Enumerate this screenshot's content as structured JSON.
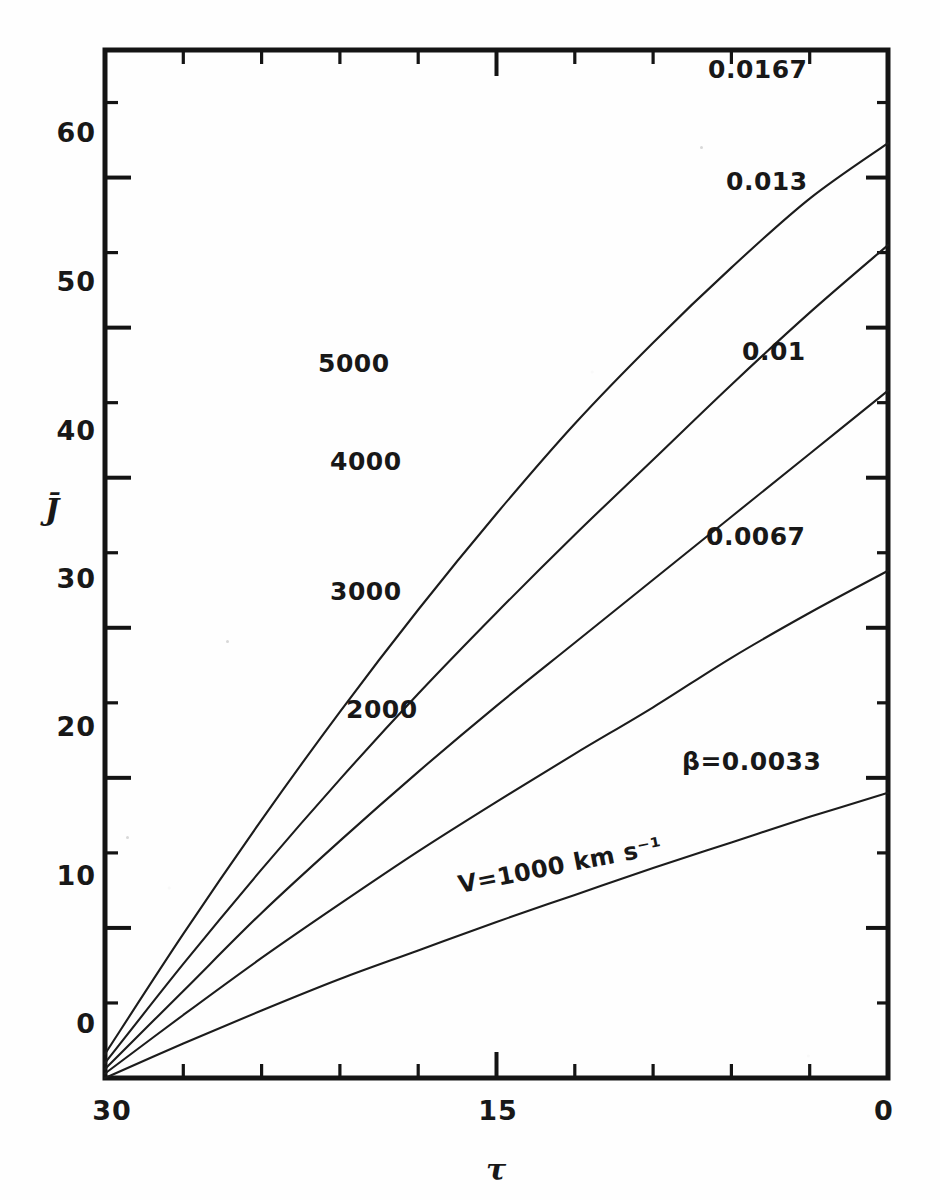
{
  "figure": {
    "kind": "line-plot",
    "background": "#fefefe",
    "ink_color": "#181818"
  },
  "chart_data": {
    "type": "line",
    "title": "",
    "subtitle": "",
    "xlabel": "τ",
    "ylabel": "J̄",
    "xlim": [
      30,
      0
    ],
    "ylim": [
      0,
      68.5
    ],
    "x_reversed": true,
    "grid": false,
    "legend_position": "inline-curve-labels",
    "xticks_major": [
      30,
      15,
      0
    ],
    "xtick_labels": [
      "30",
      "15",
      "0"
    ],
    "xticks_minor": [
      27,
      24,
      21,
      18,
      12,
      9,
      6,
      3
    ],
    "yticks_major": [
      0,
      10,
      20,
      30,
      40,
      50,
      60
    ],
    "ytick_labels": [
      "0",
      "10",
      "20",
      "30",
      "40",
      "50",
      "60"
    ],
    "series": [
      {
        "name": "beta=0.0033",
        "beta_label": "β=0.0033",
        "velocity_label": "V=1000 km s⁻¹",
        "beta": 0.0033,
        "velocity_km_s": 1000,
        "x": [
          30,
          27,
          24,
          21,
          18,
          15,
          12,
          9,
          6,
          3,
          0
        ],
        "y": [
          0.0,
          2.3,
          4.5,
          6.6,
          8.5,
          10.4,
          12.2,
          14.0,
          15.7,
          17.4,
          19.0
        ]
      },
      {
        "name": "beta=0.0067",
        "beta_label": "0.0067",
        "velocity_label": "2000",
        "beta": 0.0067,
        "velocity_km_s": 2000,
        "x": [
          30,
          27,
          24,
          21,
          18,
          15,
          12,
          9,
          6,
          3,
          0
        ],
        "y": [
          0.3,
          4.2,
          8.0,
          11.6,
          15.1,
          18.4,
          21.6,
          24.7,
          28.0,
          31.0,
          33.8
        ]
      },
      {
        "name": "beta=0.01",
        "beta_label": "0.01",
        "velocity_label": "3000",
        "beta": 0.01,
        "velocity_km_s": 3000,
        "x": [
          30,
          27,
          24,
          21,
          18,
          15,
          12,
          9,
          6,
          3,
          0
        ],
        "y": [
          0.6,
          5.8,
          11.0,
          15.8,
          20.4,
          24.8,
          29.0,
          33.2,
          37.4,
          41.6,
          45.8
        ]
      },
      {
        "name": "beta=0.013",
        "beta_label": "0.013",
        "velocity_label": "4000",
        "beta": 0.013,
        "velocity_km_s": 4000,
        "x": [
          30,
          27,
          24,
          21,
          18,
          15,
          12,
          9,
          6,
          3,
          0
        ],
        "y": [
          1.0,
          7.6,
          13.9,
          19.9,
          25.6,
          31.0,
          36.2,
          41.2,
          46.2,
          51.0,
          55.5
        ]
      },
      {
        "name": "beta=0.0167",
        "beta_label": "0.0167",
        "velocity_label": "5000",
        "beta": 0.0167,
        "velocity_km_s": 5000,
        "x": [
          30,
          27,
          24,
          21,
          18,
          15,
          12,
          9,
          6,
          3,
          0
        ],
        "y": [
          1.6,
          9.6,
          17.2,
          24.4,
          31.2,
          37.6,
          43.6,
          49.0,
          54.0,
          58.6,
          62.3
        ]
      }
    ],
    "annotations": [
      {
        "id": "beta-0167",
        "text": "0.0167",
        "x_px": 708,
        "y_px": 78
      },
      {
        "id": "beta-013",
        "text": "0.013",
        "x_px": 726,
        "y_px": 190
      },
      {
        "id": "beta-01",
        "text": "0.01",
        "x_px": 742,
        "y_px": 360
      },
      {
        "id": "beta-0067",
        "text": "0.0067",
        "x_px": 706,
        "y_px": 545
      },
      {
        "id": "beta-0033",
        "text": "β=0.0033",
        "x_px": 682,
        "y_px": 770
      },
      {
        "id": "v-5000",
        "text": "5000",
        "x_px": 318,
        "y_px": 372
      },
      {
        "id": "v-4000",
        "text": "4000",
        "x_px": 330,
        "y_px": 470
      },
      {
        "id": "v-3000",
        "text": "3000",
        "x_px": 330,
        "y_px": 600
      },
      {
        "id": "v-2000",
        "text": "2000",
        "x_px": 346,
        "y_px": 718
      },
      {
        "id": "v-1000",
        "text": "V=1000 km s⁻¹",
        "x_px": 460,
        "y_px": 893
      }
    ]
  },
  "axes": {
    "x_axis_title": "τ",
    "y_axis_title": "J̄",
    "x_tick_labels": [
      "30",
      "15",
      "0"
    ],
    "y_tick_labels": [
      "60",
      "50",
      "40",
      "30",
      "20",
      "10",
      "0"
    ]
  }
}
